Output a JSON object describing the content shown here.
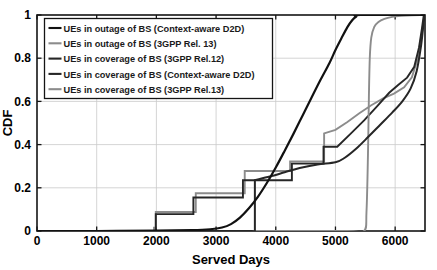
{
  "chart_data": {
    "type": "line",
    "title": "",
    "xlabel": "Served Days",
    "ylabel": "CDF",
    "xlim": [
      0,
      6500
    ],
    "ylim": [
      0,
      1
    ],
    "grid": true,
    "legend_position": "upper-left",
    "xticks": [
      0,
      1000,
      2000,
      3000,
      4000,
      5000,
      6000
    ],
    "xtick_labels": [
      "0",
      "1000",
      "2000",
      "3000",
      "4000",
      "5000",
      "6000"
    ],
    "yticks": [
      0,
      0.2,
      0.4,
      0.6,
      0.8,
      1
    ],
    "ytick_labels": [
      "0",
      "0.2",
      "0.4",
      "0.6",
      "0.8",
      "1"
    ],
    "series": [
      {
        "name": "UEs in outage of BS (Context-aware D2D)",
        "color": "#111111",
        "width": 2.2,
        "style": "smooth",
        "points": [
          [
            0,
            0.0
          ],
          [
            1000,
            0.0
          ],
          [
            2000,
            0.002
          ],
          [
            2600,
            0.004
          ],
          [
            2900,
            0.008
          ],
          [
            3100,
            0.016
          ],
          [
            3250,
            0.032
          ],
          [
            3400,
            0.062
          ],
          [
            3550,
            0.105
          ],
          [
            3700,
            0.158
          ],
          [
            3850,
            0.222
          ],
          [
            4000,
            0.294
          ],
          [
            4150,
            0.372
          ],
          [
            4300,
            0.452
          ],
          [
            4450,
            0.535
          ],
          [
            4600,
            0.618
          ],
          [
            4750,
            0.7
          ],
          [
            4900,
            0.778
          ],
          [
            5000,
            0.838
          ],
          [
            5100,
            0.892
          ],
          [
            5200,
            0.944
          ],
          [
            5280,
            0.976
          ],
          [
            5350,
            0.993
          ],
          [
            5420,
            1.0
          ],
          [
            6500,
            1.0
          ]
        ]
      },
      {
        "name": "UEs in outage of BS (3GPP Rel. 13)",
        "color": "#8c8c8c",
        "width": 1.9,
        "style": "smooth",
        "points": [
          [
            0,
            0.0
          ],
          [
            2000,
            0.0
          ],
          [
            4000,
            0.0
          ],
          [
            5200,
            0.0
          ],
          [
            5480,
            0.0
          ],
          [
            5520,
            0.09
          ],
          [
            5545,
            0.36
          ],
          [
            5560,
            0.62
          ],
          [
            5575,
            0.8
          ],
          [
            5600,
            0.895
          ],
          [
            5650,
            0.945
          ],
          [
            5720,
            0.968
          ],
          [
            5820,
            0.982
          ],
          [
            5950,
            0.991
          ],
          [
            6100,
            0.996
          ],
          [
            6280,
            0.999
          ],
          [
            6450,
            1.0
          ],
          [
            6500,
            1.0
          ]
        ]
      },
      {
        "name": "UEs in coverage of BS (3GPP Rel.12)",
        "color": "#262626",
        "width": 1.9,
        "style": "step",
        "points": [
          [
            0,
            0.0
          ],
          [
            1990,
            0.0
          ],
          [
            1990,
            0.078
          ],
          [
            2620,
            0.078
          ],
          [
            2620,
            0.155
          ],
          [
            3450,
            0.155
          ],
          [
            3450,
            0.235
          ],
          [
            4270,
            0.235
          ],
          [
            4270,
            0.312
          ],
          [
            4800,
            0.312
          ],
          [
            4800,
            0.39
          ],
          [
            5030,
            0.39
          ],
          [
            5260,
            0.452
          ],
          [
            5480,
            0.512
          ],
          [
            5700,
            0.578
          ],
          [
            5900,
            0.64
          ],
          [
            6050,
            0.676
          ],
          [
            6200,
            0.71
          ],
          [
            6320,
            0.76
          ],
          [
            6400,
            0.85
          ],
          [
            6450,
            0.94
          ],
          [
            6480,
            1.0
          ],
          [
            6500,
            1.0
          ]
        ]
      },
      {
        "name": "UEs in coverage of BS (Context-aware D2D)",
        "color": "#262626",
        "width": 2.0,
        "style": "smooth",
        "points": [
          [
            0,
            0.0
          ],
          [
            2000,
            0.0
          ],
          [
            3000,
            0.0
          ],
          [
            3600,
            0.0
          ],
          [
            3650,
            0.0
          ],
          [
            3650,
            0.235
          ],
          [
            3660,
            0.236
          ],
          [
            3900,
            0.252
          ],
          [
            4150,
            0.272
          ],
          [
            4400,
            0.292
          ],
          [
            4700,
            0.308
          ],
          [
            5000,
            0.318
          ],
          [
            5150,
            0.338
          ],
          [
            5350,
            0.382
          ],
          [
            5550,
            0.436
          ],
          [
            5750,
            0.492
          ],
          [
            5950,
            0.548
          ],
          [
            6120,
            0.6
          ],
          [
            6260,
            0.66
          ],
          [
            6360,
            0.74
          ],
          [
            6430,
            0.85
          ],
          [
            6470,
            0.945
          ],
          [
            6495,
            1.0
          ],
          [
            6500,
            1.0
          ]
        ]
      },
      {
        "name": "UEs in coverage of BS (3GPP Rel.13)",
        "color": "#8c8c8c",
        "width": 1.9,
        "style": "step",
        "points": [
          [
            0,
            0.0
          ],
          [
            1960,
            0.0
          ],
          [
            1960,
            0.015
          ],
          [
            1990,
            0.015
          ],
          [
            1990,
            0.088
          ],
          [
            2660,
            0.088
          ],
          [
            2660,
            0.175
          ],
          [
            3480,
            0.175
          ],
          [
            3480,
            0.278
          ],
          [
            4240,
            0.278
          ],
          [
            4240,
            0.322
          ],
          [
            4810,
            0.322
          ],
          [
            4810,
            0.452
          ],
          [
            5000,
            0.468
          ],
          [
            5200,
            0.505
          ],
          [
            5400,
            0.545
          ],
          [
            5600,
            0.582
          ],
          [
            5800,
            0.614
          ],
          [
            5980,
            0.636
          ],
          [
            6150,
            0.665
          ],
          [
            6280,
            0.712
          ],
          [
            6380,
            0.8
          ],
          [
            6450,
            0.92
          ],
          [
            6490,
            1.0
          ],
          [
            6500,
            1.0
          ]
        ]
      }
    ],
    "legend_entries": [
      "UEs in outage of BS (Context-aware D2D)",
      "UEs in outage of BS (3GPP Rel. 13)",
      "UEs in coverage of BS (3GPP Rel.12)",
      "UEs in coverage of BS (Context-aware D2D)",
      "UEs in coverage of BS (3GPP Rel.13)"
    ],
    "legend_colors": [
      "#111111",
      "#8c8c8c",
      "#262626",
      "#262626",
      "#8c8c8c"
    ]
  }
}
